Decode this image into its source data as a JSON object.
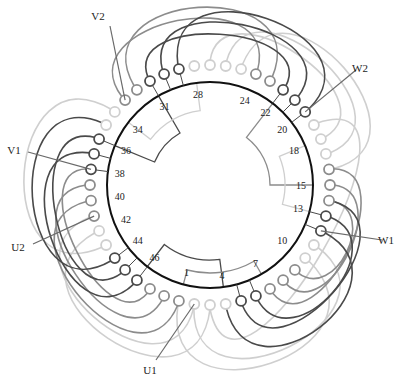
{
  "diagram": {
    "center": [
      210,
      185
    ],
    "stator_radius": 103,
    "slot_label_radius": 91,
    "terminal_radius": 120,
    "total_slots": 48,
    "slot_angle_deg": 7.5,
    "zero_slot": 15,
    "colors": {
      "stator": "#111111",
      "dark": "#4a4a4a",
      "mid": "#8c8c8c",
      "light": "#cfcfcf",
      "lead": "#6a6a6a"
    },
    "slot_labels": [
      "1",
      "4",
      "7",
      "10",
      "13",
      "15",
      "18",
      "20",
      "22",
      "24",
      "28",
      "31",
      "34",
      "36",
      "38",
      "40",
      "42",
      "44",
      "46"
    ],
    "slot_label_positions": [
      1,
      4,
      7,
      10,
      13,
      15,
      18,
      20,
      22,
      24,
      28,
      31,
      34,
      36,
      38,
      40,
      42,
      44,
      46
    ],
    "terminals": [
      {
        "slot": 29,
        "shade": "dark"
      },
      {
        "slot": 30,
        "shade": "dark"
      },
      {
        "slot": 31,
        "shade": "dark"
      },
      {
        "slot": 32,
        "shade": "mid"
      },
      {
        "slot": 33,
        "shade": "mid"
      },
      {
        "slot": 34,
        "shade": "light"
      },
      {
        "slot": 35,
        "shade": "light"
      },
      {
        "slot": 36,
        "shade": "dark"
      },
      {
        "slot": 37,
        "shade": "dark"
      },
      {
        "slot": 38,
        "shade": "dark"
      },
      {
        "slot": 39,
        "shade": "mid"
      },
      {
        "slot": 40,
        "shade": "mid"
      },
      {
        "slot": 41,
        "shade": "mid"
      },
      {
        "slot": 42,
        "shade": "light"
      },
      {
        "slot": 43,
        "shade": "light"
      },
      {
        "slot": 44,
        "shade": "dark"
      },
      {
        "slot": 45,
        "shade": "dark"
      },
      {
        "slot": 46,
        "shade": "dark"
      },
      {
        "slot": 47,
        "shade": "mid"
      },
      {
        "slot": 48,
        "shade": "mid"
      },
      {
        "slot": 1,
        "shade": "mid"
      },
      {
        "slot": 2,
        "shade": "light"
      },
      {
        "slot": 3,
        "shade": "light"
      },
      {
        "slot": 4,
        "shade": "light"
      },
      {
        "slot": 5,
        "shade": "dark"
      },
      {
        "slot": 6,
        "shade": "dark"
      },
      {
        "slot": 7,
        "shade": "mid"
      },
      {
        "slot": 8,
        "shade": "mid"
      },
      {
        "slot": 9,
        "shade": "mid"
      },
      {
        "slot": 10,
        "shade": "light"
      },
      {
        "slot": 11,
        "shade": "light"
      },
      {
        "slot": 12,
        "shade": "dark"
      },
      {
        "slot": 13,
        "shade": "dark"
      },
      {
        "slot": 14,
        "shade": "mid"
      },
      {
        "slot": 15,
        "shade": "mid"
      },
      {
        "slot": 16,
        "shade": "mid"
      },
      {
        "slot": 17,
        "shade": "light"
      },
      {
        "slot": 18,
        "shade": "light"
      },
      {
        "slot": 19,
        "shade": "light"
      },
      {
        "slot": 20,
        "shade": "dark"
      },
      {
        "slot": 21,
        "shade": "dark"
      },
      {
        "slot": 22,
        "shade": "dark"
      },
      {
        "slot": 23,
        "shade": "mid"
      },
      {
        "slot": 24,
        "shade": "mid"
      },
      {
        "slot": 25,
        "shade": "light"
      },
      {
        "slot": 26,
        "shade": "light"
      },
      {
        "slot": 27,
        "shade": "light"
      },
      {
        "slot": 28,
        "shade": "light"
      }
    ],
    "coils": [
      {
        "from": 29,
        "to": 20,
        "shade": "dark",
        "bulge": 70
      },
      {
        "from": 30,
        "to": 21,
        "shade": "dark",
        "bulge": 58
      },
      {
        "from": 31,
        "to": 22,
        "shade": "dark",
        "bulge": 46
      },
      {
        "from": 33,
        "to": 24,
        "shade": "mid",
        "bulge": 62
      },
      {
        "from": 32,
        "to": 23,
        "shade": "mid",
        "bulge": 72
      },
      {
        "from": 27,
        "to": 18,
        "shade": "light",
        "bulge": 52
      },
      {
        "from": 26,
        "to": 17,
        "shade": "light",
        "bulge": 62
      },
      {
        "from": 25,
        "to": 16,
        "shade": "light",
        "bulge": 72
      },
      {
        "from": 36,
        "to": 45,
        "shade": "dark",
        "bulge": 52
      },
      {
        "from": 37,
        "to": 46,
        "shade": "dark",
        "bulge": 62
      },
      {
        "from": 35,
        "to": 44,
        "shade": "dark",
        "bulge": 72
      },
      {
        "from": 34,
        "to": 43,
        "shade": "light",
        "bulge": 80
      },
      {
        "from": 38,
        "to": 47,
        "shade": "mid",
        "bulge": 44
      },
      {
        "from": 39,
        "to": 48,
        "shade": "mid",
        "bulge": 56
      },
      {
        "from": 40,
        "to": 1,
        "shade": "mid",
        "bulge": 66
      },
      {
        "from": 41,
        "to": 2,
        "shade": "light",
        "bulge": 70
      },
      {
        "from": 42,
        "to": 3,
        "shade": "light",
        "bulge": 78
      },
      {
        "from": 5,
        "to": 14,
        "shade": "dark",
        "bulge": 58
      },
      {
        "from": 6,
        "to": 13,
        "shade": "dark",
        "bulge": 48
      },
      {
        "from": 4,
        "to": 12,
        "shade": "dark",
        "bulge": 68
      },
      {
        "from": 7,
        "to": 16,
        "shade": "mid",
        "bulge": 48
      },
      {
        "from": 8,
        "to": 15,
        "shade": "mid",
        "bulge": 40
      },
      {
        "from": 9,
        "to": 14,
        "shade": "mid",
        "bulge": 32
      },
      {
        "from": 2,
        "to": 11,
        "shade": "light",
        "bulge": 74
      },
      {
        "from": 1,
        "to": 10,
        "shade": "light",
        "bulge": 82
      },
      {
        "from": 3,
        "to": 19,
        "shade": "light",
        "bulge": 88
      }
    ],
    "jumpers": [
      {
        "a": 31,
        "b": 36,
        "r_inner": 60,
        "shade": "dark"
      },
      {
        "a": 28,
        "b": 34,
        "r_inner": 75,
        "shade": "light"
      },
      {
        "a": 22,
        "b": 15,
        "r_inner": 60,
        "shade": "mid"
      },
      {
        "a": 18,
        "b": 13,
        "r_inner": 75,
        "shade": "light"
      },
      {
        "a": 46,
        "b": 4,
        "r_inner": 75,
        "shade": "dark"
      },
      {
        "a": 1,
        "b": 7,
        "r_inner": 88,
        "shade": "mid"
      }
    ],
    "leads": [
      {
        "label": "V2",
        "slot": 33,
        "text_xy": [
          98,
          20
        ],
        "line_end": [
          110,
          26
        ]
      },
      {
        "label": "W2",
        "slot": 20,
        "text_xy": [
          360,
          72
        ],
        "line_end": [
          356,
          70
        ]
      },
      {
        "label": "V1",
        "slot": 38,
        "text_xy": [
          14,
          154
        ],
        "line_end": [
          28,
          152
        ]
      },
      {
        "label": "W1",
        "slot": 12,
        "text_xy": [
          386,
          244
        ],
        "line_end": [
          382,
          240
        ]
      },
      {
        "label": "U2",
        "slot": 41,
        "text_xy": [
          18,
          251
        ],
        "line_end": [
          33,
          244
        ]
      },
      {
        "label": "U1",
        "slot": 2,
        "text_xy": [
          150,
          374
        ],
        "line_end": [
          156,
          360
        ]
      }
    ]
  }
}
